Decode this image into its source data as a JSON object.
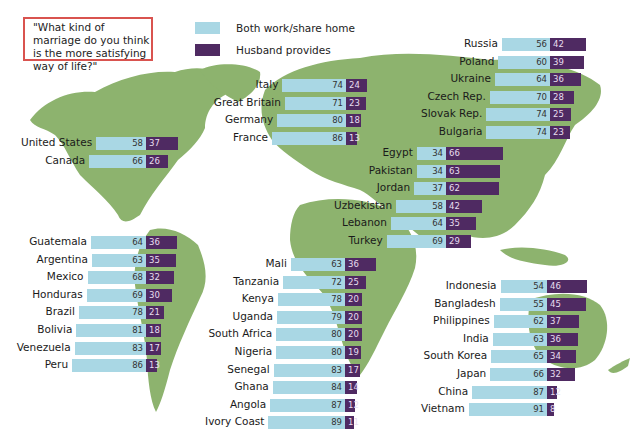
{
  "question": "\"What kind of marriage do you think is the more satisfying way of life?\"",
  "legend": [
    {
      "label": "Both work/share home",
      "color": "#a9d7e4"
    },
    {
      "label": "Husband provides",
      "color": "#4f2a62"
    }
  ],
  "colors": {
    "map_land": "#8db36e",
    "both": "#a9d7e4",
    "husband": "#4f2a62",
    "question_border": "#d9534f"
  },
  "chart_data": {
    "type": "bar",
    "title": "\"What kind of marriage do you think is the more satisfying way of life?\"",
    "orientation": "horizontal-stacked",
    "series_names": [
      "Both work/share home",
      "Husband provides"
    ],
    "groups": [
      {
        "region": "Western Europe",
        "divider_x": 346,
        "top": 79,
        "rows": [
          {
            "country": "Italy",
            "both": 74,
            "husband": 24
          },
          {
            "country": "Great Britain",
            "both": 71,
            "husband": 23
          },
          {
            "country": "Germany",
            "both": 80,
            "husband": 18
          },
          {
            "country": "France",
            "both": 86,
            "husband": 13
          }
        ]
      },
      {
        "region": "Eastern Europe",
        "divider_x": 550,
        "top": 38,
        "rows": [
          {
            "country": "Russia",
            "both": 56,
            "husband": 42
          },
          {
            "country": "Poland",
            "both": 60,
            "husband": 39
          },
          {
            "country": "Ukraine",
            "both": 64,
            "husband": 36
          },
          {
            "country": "Czech Rep.",
            "both": 70,
            "husband": 28
          },
          {
            "country": "Slovak Rep.",
            "both": 74,
            "husband": 25
          },
          {
            "country": "Bulgaria",
            "both": 74,
            "husband": 23
          }
        ]
      },
      {
        "region": "North America",
        "divider_x": 146,
        "top": 137,
        "rows": [
          {
            "country": "United States",
            "both": 58,
            "husband": 37
          },
          {
            "country": "Canada",
            "both": 66,
            "husband": 26
          }
        ]
      },
      {
        "region": "Middle East / South Asia",
        "divider_x": 446,
        "top": 147,
        "rows": [
          {
            "country": "Egypt",
            "both": 34,
            "husband": 66
          },
          {
            "country": "Pakistan",
            "both": 34,
            "husband": 63
          },
          {
            "country": "Jordan",
            "both": 37,
            "husband": 62
          },
          {
            "country": "Uzbekistan",
            "both": 58,
            "husband": 42
          },
          {
            "country": "Lebanon",
            "both": 64,
            "husband": 35
          },
          {
            "country": "Turkey",
            "both": 69,
            "husband": 29
          }
        ]
      },
      {
        "region": "Latin America",
        "divider_x": 146,
        "top": 236,
        "rows": [
          {
            "country": "Guatemala",
            "both": 64,
            "husband": 36
          },
          {
            "country": "Argentina",
            "both": 63,
            "husband": 35
          },
          {
            "country": "Mexico",
            "both": 68,
            "husband": 32
          },
          {
            "country": "Honduras",
            "both": 69,
            "husband": 30
          },
          {
            "country": "Brazil",
            "both": 78,
            "husband": 21
          },
          {
            "country": "Bolivia",
            "both": 81,
            "husband": 18
          },
          {
            "country": "Venezuela",
            "both": 83,
            "husband": 17
          },
          {
            "country": "Peru",
            "both": 86,
            "husband": 13
          }
        ]
      },
      {
        "region": "Africa",
        "divider_x": 345,
        "top": 258,
        "rows": [
          {
            "country": "Mali",
            "both": 63,
            "husband": 36
          },
          {
            "country": "Tanzania",
            "both": 72,
            "husband": 25
          },
          {
            "country": "Kenya",
            "both": 78,
            "husband": 20
          },
          {
            "country": "Uganda",
            "both": 79,
            "husband": 20
          },
          {
            "country": "South Africa",
            "both": 80,
            "husband": 20
          },
          {
            "country": "Nigeria",
            "both": 80,
            "husband": 19
          },
          {
            "country": "Senegal",
            "both": 83,
            "husband": 17
          },
          {
            "country": "Ghana",
            "both": 84,
            "husband": 14
          },
          {
            "country": "Angola",
            "both": 87,
            "husband": 12
          },
          {
            "country": "Ivory Coast",
            "both": 89,
            "husband": 11
          }
        ]
      },
      {
        "region": "Asia",
        "divider_x": 547,
        "top": 280,
        "rows": [
          {
            "country": "Indonesia",
            "both": 54,
            "husband": 46
          },
          {
            "country": "Bangladesh",
            "both": 55,
            "husband": 45
          },
          {
            "country": "Philippines",
            "both": 62,
            "husband": 37
          },
          {
            "country": "India",
            "both": 63,
            "husband": 36
          },
          {
            "country": "South Korea",
            "both": 65,
            "husband": 34
          },
          {
            "country": "Japan",
            "both": 66,
            "husband": 32
          },
          {
            "country": "China",
            "both": 87,
            "husband": 12
          },
          {
            "country": "Vietnam",
            "both": 91,
            "husband": 8
          }
        ]
      }
    ],
    "row_spacing_px": 17.6,
    "px_per_point": 0.86,
    "xlabel": "",
    "ylabel": "",
    "legend_position": "top"
  }
}
